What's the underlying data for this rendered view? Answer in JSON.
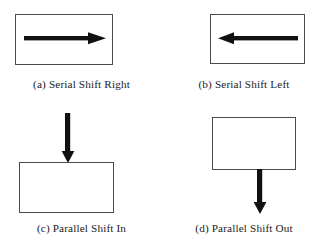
{
  "figure": {
    "background_color": "#ffffff",
    "stroke_color": "#4a4a4a",
    "arrow_color": "#111111",
    "panels": [
      {
        "key": "a",
        "caption": "(a)  Serial Shift Right",
        "shape": "register-box",
        "arrow": {
          "icon": "arrow-right-icon",
          "direction": "right",
          "placement": "inside-box"
        }
      },
      {
        "key": "b",
        "caption": "(b)  Serial Shift Left",
        "shape": "register-box",
        "arrow": {
          "icon": "arrow-left-icon",
          "direction": "left",
          "placement": "inside-box"
        }
      },
      {
        "key": "c",
        "caption": "(c)  Parallel Shift In",
        "shape": "register-box",
        "arrow": {
          "icon": "arrow-down-icon",
          "direction": "down",
          "placement": "above-box"
        }
      },
      {
        "key": "d",
        "caption": "(d) Parallel Shift Out",
        "shape": "register-box",
        "arrow": {
          "icon": "arrow-down-icon",
          "direction": "down",
          "placement": "below-box"
        }
      }
    ]
  }
}
